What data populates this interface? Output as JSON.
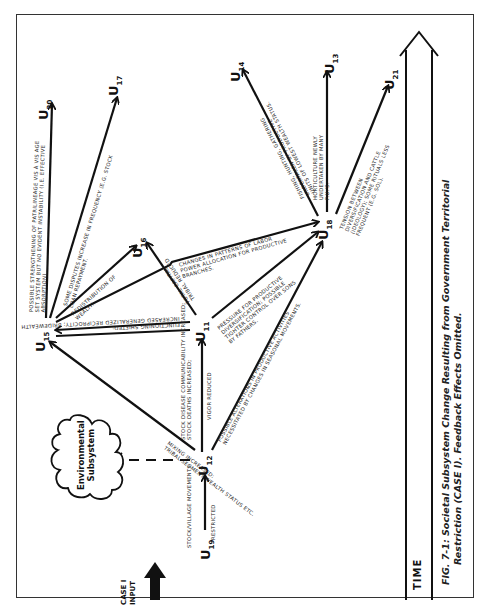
{
  "figure": {
    "caption_line1": "FIG. 7-1: Societal Subsystem Change Resulting from Government Territorial",
    "caption_line2": "Restriction (CASE I). Feedback Effects Omitted.",
    "time_label": "TIME",
    "input_label_line1": "CASE I",
    "input_label_line2": "INPUT",
    "cloud_line1": "Environmental",
    "cloud_line2": "Subsystem"
  },
  "nodes": {
    "u11": {
      "label": "U",
      "sub": "11"
    },
    "u12": {
      "label": "U",
      "sub": "12"
    },
    "u13": {
      "label": "U",
      "sub": "13"
    },
    "u14": {
      "label": "U",
      "sub": "14"
    },
    "u15": {
      "label": "U",
      "sub": "15"
    },
    "u16": {
      "label": "U",
      "sub": "16"
    },
    "u17": {
      "label": "U",
      "sub": "17"
    },
    "u18": {
      "label": "U",
      "sub": "18"
    },
    "u19": {
      "label": "U",
      "sub": "19"
    },
    "u20": {
      "label": "U",
      "sub": "20"
    },
    "u21": {
      "label": "U",
      "sub": "21"
    }
  },
  "edges": {
    "u19_u12_a": "Stock/village movements",
    "u19_u12_b": "Restricted",
    "u12_u15_a": "Mixing increased:",
    "u12_u15_b": "Tribal segment wealth status etc.",
    "u12_u11_a": "Stock disease communicability increased;",
    "u12_u11_b": "Stock deaths increased;",
    "u12_u11_c": "Vigor reduced",
    "u12_u18_a": "Possible alterations in productive activities",
    "u12_u18_b": "necessitated by changes in seasonal movements.",
    "u11_u15_a": "Functioning shifted;",
    "u11_u15_b": "Increased generalized reciprocity; bridewealth",
    "u11_u16_a": "Total capital",
    "u11_u16_b": "Tribal reduced",
    "u11_u18_a": "Pressure for productive",
    "u11_u18_b": "diversification; possible",
    "u11_u18_c": "tighter control over sons",
    "u11_u18_d": "by fathers.",
    "u15_u18_a": "Changes in patterns of labor",
    "u15_u18_b": "power allocation for productive",
    "u15_u18_c": "branches.",
    "u15_u16_a": "Redistribution of",
    "u15_u16_b": "wealth.",
    "u15_u17_a": "Some disputes increase in frequency (e.g. stock",
    "u15_u17_b": "loan repayment.",
    "u15_u20_a": "Possible strengthening of patrilineage vis à vis age",
    "u15_u20_b": "set system but no evident instability (i.e. effective",
    "u15_u20_c": "absorption)",
    "u18_u14_a": "Fishing, hunting, gathering",
    "u18_u14_b": "undertaken by productive",
    "u18_u14_c": "units of lowest wealth status.",
    "u18_u13_a": "Horticulture newly",
    "u18_u13_b": "undertaken by many",
    "u18_u13_c": "P.U.'s.",
    "u18_u21_a": "Tension between",
    "u18_u21_b": "diversification and cattle",
    "u18_u21_c": "(ideology); some rituals less",
    "u18_u21_d": "frequent (e.g. Sol)."
  }
}
